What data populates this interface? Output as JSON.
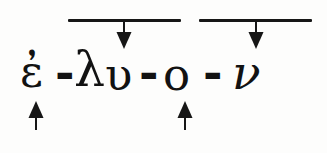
{
  "figure": {
    "type": "morphological-segmentation-diagram",
    "language": "Ancient Greek",
    "word": "ἐλυον",
    "segmented_word": "ἐ-λυ-ο-ν",
    "background_color": "#fdfdfc",
    "ink_color": "#121212"
  },
  "word_line": {
    "segments": [
      {
        "id": "seg1",
        "text": "ἐ",
        "name": "augment-epsilon"
      },
      {
        "id": "sep1",
        "text": "-",
        "name": "hyphen"
      },
      {
        "id": "seg2",
        "text": "λ",
        "name": "root-lambda"
      },
      {
        "id": "seg2b",
        "text": "υ",
        "name": "root-upsilon"
      },
      {
        "id": "sep2",
        "text": "-",
        "name": "hyphen"
      },
      {
        "id": "seg3",
        "text": "ο",
        "name": "thematic-vowel-omicron"
      },
      {
        "id": "sep3",
        "text": "-",
        "name": "hyphen"
      },
      {
        "id": "seg4",
        "text": "ν",
        "name": "ending-nu"
      }
    ]
  },
  "overbars": [
    {
      "id": "bar1",
      "label": "",
      "x": 68,
      "y": 19,
      "width": 113
    },
    {
      "id": "bar2",
      "label": "",
      "x": 199,
      "y": 19,
      "width": 113
    }
  ],
  "arrows": [
    {
      "id": "down1",
      "direction": "down",
      "x": 115,
      "y": 22,
      "points_to": "λυ"
    },
    {
      "id": "down2",
      "direction": "down",
      "x": 247,
      "y": 22,
      "points_to": "ο"
    },
    {
      "id": "up1",
      "direction": "up",
      "x": 27,
      "y": 100,
      "points_to": "ἐ"
    },
    {
      "id": "up2",
      "direction": "up",
      "x": 176,
      "y": 100,
      "points_to": "ο"
    }
  ],
  "colors": {
    "ink": "#121212",
    "bar": "#161616",
    "background": "#fdfdfc"
  }
}
